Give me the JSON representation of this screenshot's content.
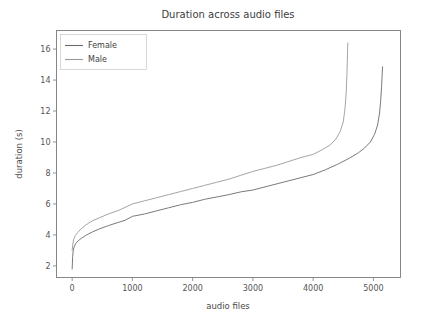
{
  "figure": {
    "background_color": "#ffffff",
    "axes_color": "#7a7a7a"
  },
  "chart_data": {
    "type": "line",
    "title": "Duration across audio files",
    "xlabel": "audio files",
    "ylabel": "duration (s)",
    "xlim": [
      -260,
      5450
    ],
    "ylim": [
      1.25,
      17.2
    ],
    "xticks": [
      0,
      1000,
      2000,
      3000,
      4000,
      5000
    ],
    "xticklabels": [
      "0",
      "1000",
      "2000",
      "3000",
      "4000",
      "5000"
    ],
    "yticks": [
      2,
      4,
      6,
      8,
      10,
      12,
      14,
      16
    ],
    "yticklabels": [
      "2",
      "4",
      "6",
      "8",
      "10",
      "12",
      "14",
      "16"
    ],
    "grid": false,
    "legend": {
      "position": "upper left",
      "entries": [
        "Female",
        "Male"
      ]
    },
    "series": [
      {
        "name": "Female",
        "color": "#6b6b6b",
        "linewidth": 0.9,
        "points": [
          [
            0,
            1.8
          ],
          [
            8,
            2.6
          ],
          [
            18,
            3.0
          ],
          [
            35,
            3.25
          ],
          [
            60,
            3.45
          ],
          [
            100,
            3.62
          ],
          [
            160,
            3.8
          ],
          [
            240,
            4.0
          ],
          [
            340,
            4.2
          ],
          [
            460,
            4.4
          ],
          [
            600,
            4.6
          ],
          [
            760,
            4.8
          ],
          [
            880,
            4.95
          ],
          [
            1000,
            5.2
          ],
          [
            1200,
            5.35
          ],
          [
            1400,
            5.55
          ],
          [
            1600,
            5.75
          ],
          [
            1800,
            5.95
          ],
          [
            2000,
            6.1
          ],
          [
            2200,
            6.3
          ],
          [
            2400,
            6.45
          ],
          [
            2600,
            6.6
          ],
          [
            2800,
            6.78
          ],
          [
            3000,
            6.9
          ],
          [
            3200,
            7.1
          ],
          [
            3400,
            7.3
          ],
          [
            3600,
            7.5
          ],
          [
            3800,
            7.7
          ],
          [
            4000,
            7.9
          ],
          [
            4200,
            8.2
          ],
          [
            4400,
            8.55
          ],
          [
            4600,
            8.95
          ],
          [
            4750,
            9.3
          ],
          [
            4850,
            9.6
          ],
          [
            4950,
            10.0
          ],
          [
            5020,
            10.5
          ],
          [
            5070,
            11.1
          ],
          [
            5100,
            11.8
          ],
          [
            5120,
            12.6
          ],
          [
            5135,
            13.5
          ],
          [
            5145,
            14.3
          ],
          [
            5152,
            14.85
          ]
        ]
      },
      {
        "name": "Male",
        "color": "#9a9a9a",
        "linewidth": 0.9,
        "points": [
          [
            0,
            3.0
          ],
          [
            10,
            3.4
          ],
          [
            25,
            3.7
          ],
          [
            50,
            3.95
          ],
          [
            90,
            4.15
          ],
          [
            150,
            4.4
          ],
          [
            230,
            4.65
          ],
          [
            330,
            4.9
          ],
          [
            450,
            5.1
          ],
          [
            600,
            5.35
          ],
          [
            780,
            5.6
          ],
          [
            1000,
            6.0
          ],
          [
            1200,
            6.2
          ],
          [
            1400,
            6.4
          ],
          [
            1600,
            6.6
          ],
          [
            1800,
            6.8
          ],
          [
            2000,
            7.0
          ],
          [
            2200,
            7.2
          ],
          [
            2400,
            7.4
          ],
          [
            2600,
            7.6
          ],
          [
            2800,
            7.85
          ],
          [
            3000,
            8.1
          ],
          [
            3200,
            8.3
          ],
          [
            3400,
            8.5
          ],
          [
            3600,
            8.75
          ],
          [
            3800,
            9.0
          ],
          [
            4000,
            9.2
          ],
          [
            4150,
            9.5
          ],
          [
            4280,
            9.8
          ],
          [
            4380,
            10.2
          ],
          [
            4450,
            10.7
          ],
          [
            4500,
            11.3
          ],
          [
            4530,
            12.2
          ],
          [
            4550,
            13.3
          ],
          [
            4562,
            14.5
          ],
          [
            4570,
            15.6
          ],
          [
            4575,
            16.4
          ]
        ]
      }
    ]
  }
}
